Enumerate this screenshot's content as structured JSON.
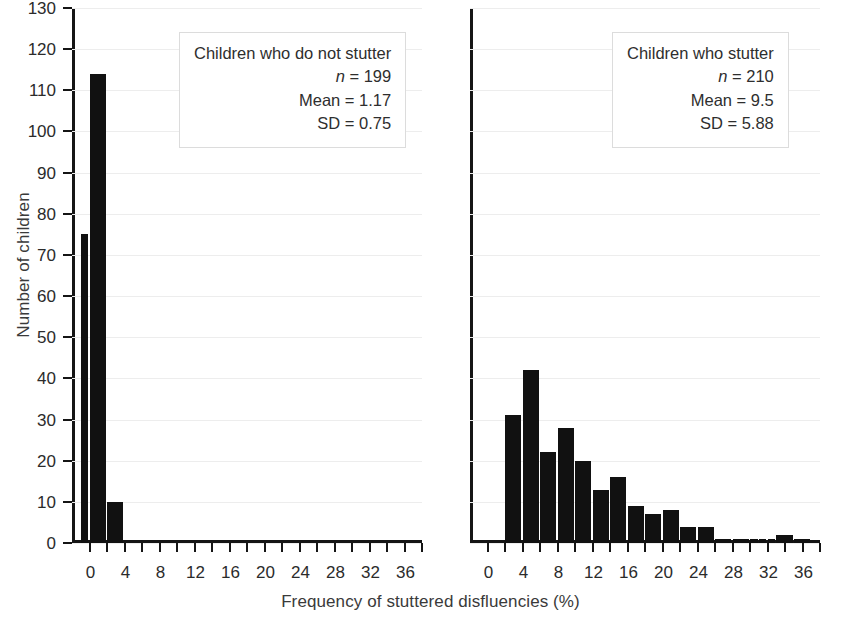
{
  "chart_data": {
    "type": "bar",
    "title": "",
    "subtitle": "",
    "xlabel": "Frequency of stuttered disfluencies (%)",
    "ylabel": "Number of children",
    "ylim": [
      0,
      130
    ],
    "ytick_step": 10,
    "ytick_labels": [
      "0",
      "10",
      "20",
      "30",
      "40",
      "50",
      "60",
      "70",
      "80",
      "90",
      "100",
      "110",
      "120",
      "130"
    ],
    "xlim": [
      -2,
      38
    ],
    "xtick_step": 2,
    "xtick_labels": [
      "0",
      "4",
      "8",
      "12",
      "16",
      "20",
      "24",
      "28",
      "32",
      "36"
    ],
    "xtick_label_values": [
      0,
      4,
      8,
      12,
      16,
      20,
      24,
      28,
      32,
      36
    ],
    "grid": "horizontal",
    "legend": "none",
    "bar_color": "#111111",
    "grid_color": "#ededed",
    "axis_color": "#151515",
    "panels": [
      {
        "id": "children-who-do-not-stutter",
        "annotation": {
          "title": "Children who do not stutter",
          "n_label": "n",
          "n_value": "= 199",
          "mean": "Mean = 1.17",
          "sd": "SD = 0.75"
        },
        "bins": [
          {
            "x0": -1,
            "x1": 0,
            "value": 75
          },
          {
            "x0": 0,
            "x1": 2,
            "value": 114
          },
          {
            "x0": 2,
            "x1": 4,
            "value": 10
          }
        ]
      },
      {
        "id": "children-who-stutter",
        "annotation": {
          "title": "Children who stutter",
          "n_label": "n",
          "n_value": "= 210",
          "mean": "Mean = 9.5",
          "sd": "SD = 5.88"
        },
        "bins": [
          {
            "x0": 2,
            "x1": 4,
            "value": 31
          },
          {
            "x0": 4,
            "x1": 6,
            "value": 42
          },
          {
            "x0": 6,
            "x1": 8,
            "value": 22
          },
          {
            "x0": 8,
            "x1": 10,
            "value": 28
          },
          {
            "x0": 10,
            "x1": 12,
            "value": 20
          },
          {
            "x0": 12,
            "x1": 14,
            "value": 13
          },
          {
            "x0": 14,
            "x1": 16,
            "value": 16
          },
          {
            "x0": 16,
            "x1": 18,
            "value": 9
          },
          {
            "x0": 18,
            "x1": 20,
            "value": 7
          },
          {
            "x0": 20,
            "x1": 22,
            "value": 8
          },
          {
            "x0": 22,
            "x1": 24,
            "value": 4
          },
          {
            "x0": 24,
            "x1": 26,
            "value": 4
          },
          {
            "x0": 26,
            "x1": 28,
            "value": 1
          },
          {
            "x0": 28,
            "x1": 30,
            "value": 1
          },
          {
            "x0": 30,
            "x1": 31,
            "value": 1
          },
          {
            "x0": 31,
            "x1": 32,
            "value": 1
          },
          {
            "x0": 32,
            "x1": 33,
            "value": 1
          },
          {
            "x0": 33,
            "x1": 35,
            "value": 2
          },
          {
            "x0": 35,
            "x1": 37,
            "value": 1
          }
        ]
      }
    ]
  }
}
